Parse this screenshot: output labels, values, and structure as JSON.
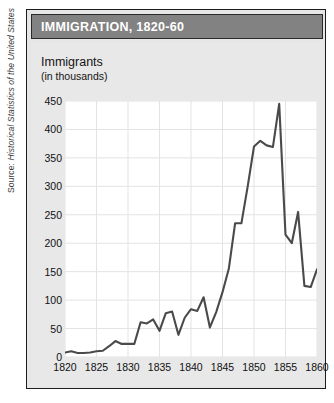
{
  "source_credit": {
    "label": "Source: ",
    "title": "Historical Statistics of the United States"
  },
  "panel": {
    "title": "IMMIGRATION, 1820-60",
    "title_bar_color": "#828282",
    "title_text_color": "#ffffff",
    "body_color": "#e8e8e8",
    "border_color": "#1d1d1d"
  },
  "axis_caption": {
    "main": "Immigrants",
    "sub": "(in thousands)"
  },
  "chart_data": {
    "type": "line",
    "title": "IMMIGRATION, 1820-60",
    "xlabel": "",
    "ylabel": "Immigrants (in thousands)",
    "xlim": [
      1820,
      1860
    ],
    "ylim": [
      0,
      450
    ],
    "ytick_labels": [
      "0",
      "50",
      "100",
      "150",
      "200",
      "250",
      "300",
      "350",
      "400",
      "450"
    ],
    "yticks": [
      0,
      50,
      100,
      150,
      200,
      250,
      300,
      350,
      400,
      450
    ],
    "xtick_labels": [
      "1820",
      "1825",
      "1830",
      "1835",
      "1840",
      "1845",
      "1850",
      "1855",
      "1860"
    ],
    "xticks": [
      1820,
      1825,
      1830,
      1835,
      1840,
      1845,
      1850,
      1855,
      1860
    ],
    "grid": true,
    "legend": "none",
    "line_color": "#4a4a4a",
    "line_width": 2.1,
    "x": [
      1820,
      1821,
      1822,
      1823,
      1824,
      1825,
      1826,
      1827,
      1828,
      1829,
      1830,
      1831,
      1832,
      1833,
      1834,
      1835,
      1836,
      1837,
      1838,
      1839,
      1840,
      1841,
      1842,
      1843,
      1844,
      1845,
      1846,
      1847,
      1848,
      1849,
      1850,
      1851,
      1852,
      1853,
      1854,
      1855,
      1856,
      1857,
      1858,
      1859,
      1860
    ],
    "values": [
      8,
      10,
      7,
      7,
      8,
      10,
      11,
      19,
      28,
      23,
      23,
      23,
      61,
      59,
      66,
      46,
      77,
      80,
      39,
      69,
      84,
      81,
      105,
      52,
      79,
      114,
      155,
      235,
      235,
      300,
      370,
      380,
      372,
      369,
      445,
      215,
      200,
      255,
      125,
      123,
      154
    ]
  }
}
